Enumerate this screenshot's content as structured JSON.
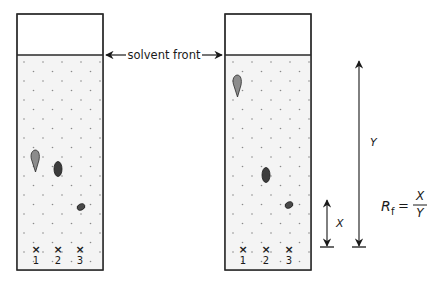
{
  "diagram": {
    "solvent_front_label": "solvent front",
    "lanes": [
      "1",
      "2",
      "3"
    ],
    "spot_marker": "×",
    "left_plate": {
      "state": "before development",
      "spots": [
        {
          "lane": "1",
          "shape": "teardrop",
          "color": "#8a8a8a"
        },
        {
          "lane": "2",
          "shape": "oval",
          "color": "#3a3a3a"
        },
        {
          "lane": "3",
          "shape": "small-oval",
          "color": "#3a3a3a"
        }
      ]
    },
    "right_plate": {
      "state": "after development",
      "spots": [
        {
          "lane": "1",
          "shape": "teardrop",
          "color": "#8a8a8a"
        },
        {
          "lane": "2",
          "shape": "oval",
          "color": "#3a3a3a"
        },
        {
          "lane": "3",
          "shape": "small-oval",
          "color": "#3a3a3a"
        }
      ]
    },
    "distance_labels": {
      "x": "X",
      "y": "Y"
    },
    "formula": {
      "lhs": "R",
      "subscript": "f",
      "equals": "=",
      "numerator": "X",
      "denominator": "Y"
    },
    "colors": {
      "stroke": "#2a2a2a",
      "plate_fill": "#f4f4f4",
      "dot": "#8a8a8a",
      "spot_light": "#8c8c8c",
      "spot_dark": "#3c3c3c"
    }
  }
}
